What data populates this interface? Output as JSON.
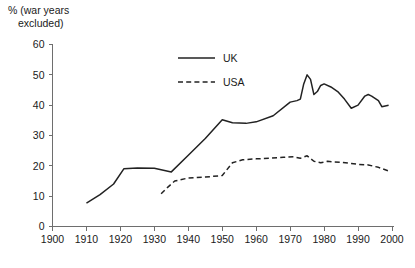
{
  "chart_data": {
    "type": "line",
    "title": "",
    "subtitle": "",
    "xlabel": "",
    "ylabel": "% (war years excluded)",
    "xlim": [
      1900,
      2000
    ],
    "ylim": [
      0,
      60
    ],
    "xticks": [
      1900,
      1910,
      1920,
      1930,
      1940,
      1950,
      1960,
      1970,
      1980,
      1990,
      2000
    ],
    "yticks": [
      0,
      10,
      20,
      30,
      40,
      50,
      60
    ],
    "grid": false,
    "legend_position": "top-center-right",
    "series": [
      {
        "name": "UK",
        "style": "solid",
        "color": "#222222",
        "points": [
          [
            1910,
            7.7
          ],
          [
            1914,
            10.5
          ],
          [
            1918,
            14.0
          ],
          [
            1921,
            19.0
          ],
          [
            1925,
            19.3
          ],
          [
            1930,
            19.2
          ],
          [
            1935,
            18.0
          ],
          [
            1940,
            23.5
          ],
          [
            1945,
            29.0
          ],
          [
            1950,
            35.2
          ],
          [
            1953,
            34.2
          ],
          [
            1957,
            34.0
          ],
          [
            1960,
            34.5
          ],
          [
            1965,
            36.5
          ],
          [
            1970,
            41.0
          ],
          [
            1972,
            41.5
          ],
          [
            1973,
            42.0
          ],
          [
            1974,
            47.0
          ],
          [
            1975,
            50.0
          ],
          [
            1976,
            48.5
          ],
          [
            1977,
            43.5
          ],
          [
            1978,
            44.5
          ],
          [
            1979,
            46.5
          ],
          [
            1980,
            47.0
          ],
          [
            1982,
            46.0
          ],
          [
            1984,
            44.5
          ],
          [
            1986,
            42.0
          ],
          [
            1988,
            39.0
          ],
          [
            1990,
            40.0
          ],
          [
            1992,
            43.0
          ],
          [
            1993,
            43.5
          ],
          [
            1994,
            43.0
          ],
          [
            1996,
            41.5
          ],
          [
            1997,
            39.5
          ],
          [
            1999,
            40.0
          ]
        ]
      },
      {
        "name": "USA",
        "style": "dashed",
        "color": "#222222",
        "points": [
          [
            1932,
            10.8
          ],
          [
            1934,
            13.0
          ],
          [
            1936,
            15.0
          ],
          [
            1940,
            16.0
          ],
          [
            1945,
            16.3
          ],
          [
            1950,
            16.8
          ],
          [
            1953,
            21.0
          ],
          [
            1956,
            22.0
          ],
          [
            1960,
            22.3
          ],
          [
            1964,
            22.5
          ],
          [
            1968,
            22.8
          ],
          [
            1971,
            23.0
          ],
          [
            1973,
            22.5
          ],
          [
            1975,
            23.3
          ],
          [
            1977,
            21.5
          ],
          [
            1979,
            21.0
          ],
          [
            1981,
            21.5
          ],
          [
            1983,
            21.3
          ],
          [
            1985,
            21.2
          ],
          [
            1988,
            20.8
          ],
          [
            1990,
            20.5
          ],
          [
            1993,
            20.3
          ],
          [
            1996,
            19.5
          ],
          [
            1999,
            18.3
          ]
        ]
      }
    ]
  },
  "legend": {
    "entries": [
      {
        "label": "UK",
        "style": "solid"
      },
      {
        "label": "USA",
        "style": "dashed"
      }
    ]
  }
}
